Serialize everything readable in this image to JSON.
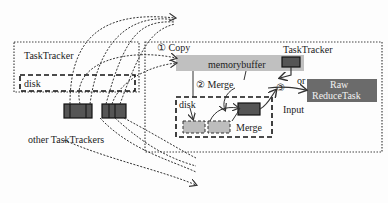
{
  "diagram": {
    "left_tracker": {
      "title": "TaskTracker",
      "disk_label": "disk",
      "others_label": "other TaskTrackers"
    },
    "right_tracker": {
      "step1": "① Copy",
      "title": "TaskTracker",
      "memory_buffer": "memorybuffer",
      "step2": "② Merge",
      "disk_label": "disk",
      "merge_label": "Merge",
      "step3": "③",
      "or_label": "or",
      "input_label": "Input",
      "reduce_task_line1": "Raw",
      "reduce_task_line2": "ReduceTask"
    },
    "colors": {
      "buffer_fill": "#c0c0c0",
      "dark_block": "#555555",
      "light_block": "#bdbdbd",
      "reduce_fill": "#6b6b6b",
      "border": "#222222"
    }
  }
}
